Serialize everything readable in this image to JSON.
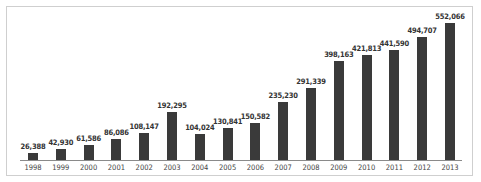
{
  "chart_data": {
    "type": "bar",
    "title": "",
    "xlabel": "",
    "ylabel": "",
    "categories": [
      "1998",
      "1999",
      "2000",
      "2001",
      "2002",
      "2003",
      "2004",
      "2005",
      "2006",
      "2007",
      "2008",
      "2009",
      "2010",
      "2011",
      "2012",
      "2013"
    ],
    "values": [
      26388,
      42930,
      61586,
      86086,
      108147,
      192295,
      104024,
      130841,
      150582,
      235230,
      291339,
      398163,
      421813,
      441590,
      494707,
      552066
    ],
    "value_labels": [
      "26,388",
      "42,930",
      "61,586",
      "86,086",
      "108,147",
      "192,295",
      "104,024",
      "130,841",
      "150,582",
      "235,230",
      "291,339",
      "398,163",
      "421,813",
      "441,590",
      "494,707",
      "552,066"
    ],
    "ylim": [
      0,
      552066
    ],
    "grid": false,
    "legend": null,
    "bar_color": "#3a3a3a"
  }
}
